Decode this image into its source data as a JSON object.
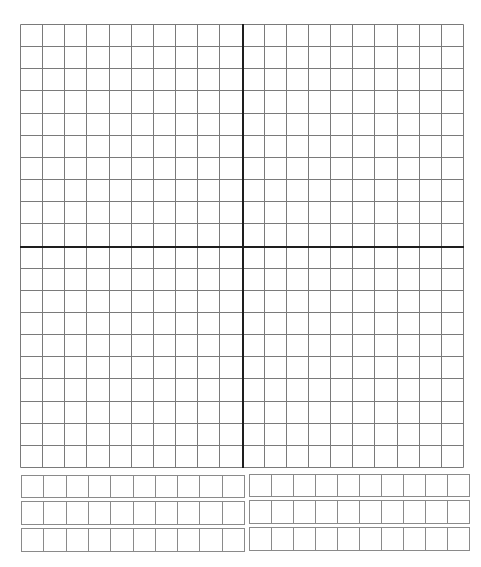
{
  "worksheet": {
    "type": "coordinate-plane-grid",
    "colors": {
      "background": "#ffffff",
      "grid_line": "#7a7a7a",
      "axis_line": "#1e1e1e",
      "strip_line": "#8a8a8a"
    }
  },
  "plane": {
    "x": 20,
    "y": 24,
    "width": 443,
    "height": 443,
    "columns": 20,
    "rows": 20,
    "axis_column": 10,
    "axis_row": 10
  },
  "answer_strips": [
    {
      "id": "left-1",
      "x": 21,
      "y": 475,
      "width": 223,
      "height": 22,
      "cells": 10
    },
    {
      "id": "left-2",
      "x": 21,
      "y": 501,
      "width": 223,
      "height": 23,
      "cells": 10
    },
    {
      "id": "left-3",
      "x": 21,
      "y": 528,
      "width": 223,
      "height": 23,
      "cells": 10
    },
    {
      "id": "right-1",
      "x": 249,
      "y": 474,
      "width": 220,
      "height": 22,
      "cells": 10
    },
    {
      "id": "right-2",
      "x": 249,
      "y": 500,
      "width": 220,
      "height": 23,
      "cells": 10
    },
    {
      "id": "right-3",
      "x": 249,
      "y": 527,
      "width": 220,
      "height": 23,
      "cells": 10
    }
  ]
}
